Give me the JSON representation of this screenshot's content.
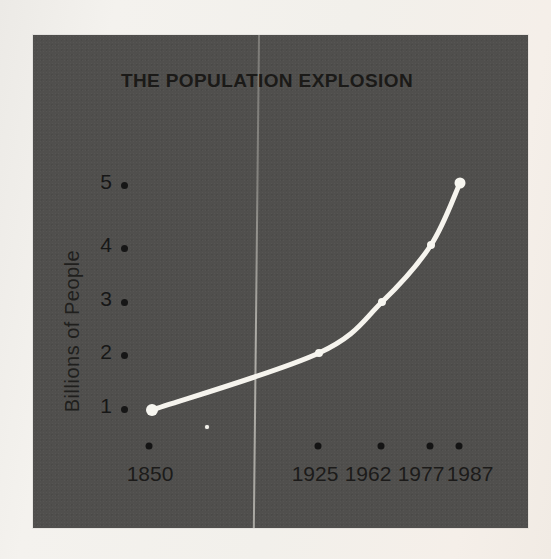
{
  "chart_data": {
    "type": "line",
    "title": "THE POPULATION EXPLOSION",
    "ylabel": "Billions of People",
    "xlabel": "",
    "categories": [
      "1850",
      "1925",
      "1962",
      "1977",
      "1987"
    ],
    "values": [
      1,
      2,
      3,
      4,
      5
    ],
    "y_ticks_top_to_bottom": [
      "5",
      "4",
      "3",
      "2",
      "1"
    ],
    "ylim": [
      1,
      5
    ],
    "grid": false,
    "legend": "none",
    "line_color": "#f6f4ee",
    "marker_color": "#f7f6f0",
    "tick_dot_color": "#161616",
    "panel_background": "#504f4d",
    "paper_background": "#f2f0eb",
    "text_color": "#1b1a18"
  }
}
